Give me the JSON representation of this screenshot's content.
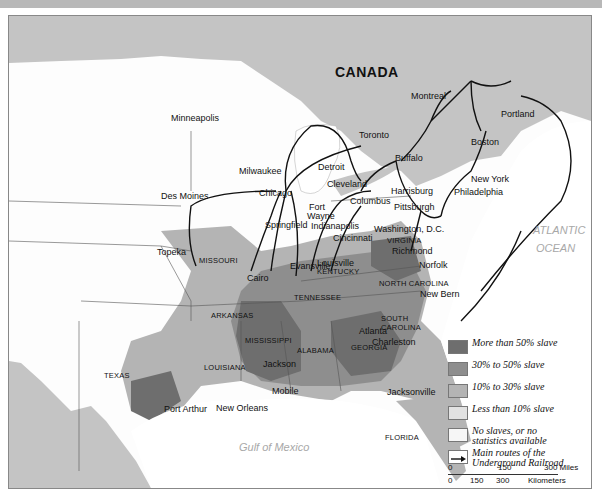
{
  "map": {
    "countries": {
      "canada": "CANADA"
    },
    "water_bodies": {
      "atlantic_1": "ATLANTIC",
      "atlantic_2": "OCEAN",
      "gulf": "Gulf of Mexico"
    },
    "states": {
      "missouri": "MISSOURI",
      "kentucky": "KENTUCKY",
      "tennessee": "TENNESSEE",
      "virginia": "VIRGINIA",
      "north_carolina": "NORTH CAROLINA",
      "south_carolina_1": "SOUTH",
      "south_carolina_2": "CAROLINA",
      "arkansas": "ARKANSAS",
      "mississippi": "MISSISSIPPI",
      "alabama": "ALABAMA",
      "georgia": "GEORGIA",
      "louisiana": "LOUISIANA",
      "texas": "TEXAS",
      "florida": "FLORIDA"
    },
    "cities": {
      "montreal": "Montreal",
      "portland": "Portland",
      "toronto": "Toronto",
      "boston": "Boston",
      "buffalo": "Buffalo",
      "new_york": "New York",
      "minneapolis": "Minneapolis",
      "milwaukee": "Milwaukee",
      "detroit": "Detroit",
      "cleveland": "Cleveland",
      "harrisburg": "Harrisburg",
      "philadelphia": "Philadelphia",
      "des_moines": "Des Moines",
      "chicago": "Chicago",
      "fort": "Fort",
      "wayne": "Wayne",
      "columbus": "Columbus",
      "pittsburgh": "Pittsburgh",
      "springfield": "Springfield",
      "indianapolis": "Indianapolis",
      "cincinnati": "Cincinnati",
      "washington": "Washington, D.C.",
      "topeka": "Topeka",
      "louisville": "Louisville",
      "richmond": "Richmond",
      "evansville": "Evansville",
      "norfolk": "Norfolk",
      "cairo": "Cairo",
      "new_bern": "New Bern",
      "atlanta": "Atlanta",
      "charleston": "Charleston",
      "jackson": "Jackson",
      "mobile": "Mobile",
      "jacksonville": "Jacksonville",
      "port_arthur": "Port Arthur",
      "new_orleans": "New Orleans"
    }
  },
  "legend": {
    "items": [
      {
        "label": "More than 50% slave",
        "color": "#6e6e6e"
      },
      {
        "label": "30% to 50% slave",
        "color": "#8e8e8e"
      },
      {
        "label": "10% to 30% slave",
        "color": "#b4b4b4"
      },
      {
        "label": "Less than 10% slave",
        "color": "#e2e2e2"
      },
      {
        "label_1": "No slaves, or no",
        "label_2": "statistics available",
        "color": "#f6f6f6"
      },
      {
        "label_1": "Main routes of the",
        "label_2": "Underground Railroad"
      }
    ],
    "scale": {
      "miles": [
        "0",
        "150",
        "300 Miles"
      ],
      "km": [
        "0",
        "150",
        "300",
        "Kilometers"
      ]
    }
  }
}
